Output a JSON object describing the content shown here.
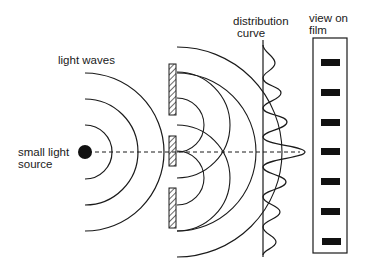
{
  "diagram": {
    "labels": {
      "light_waves": "light waves",
      "source_line1": "small light",
      "source_line2": "source",
      "distribution_line1": "distribution",
      "distribution_line2": "curve",
      "film_line1": "view on",
      "film_line2": "film"
    },
    "components": {
      "source": {
        "cx": 85,
        "cy": 152,
        "r": 7
      },
      "source_wave_radii": [
        27,
        53,
        79
      ],
      "barrier_pieces": [
        {
          "y1": 64,
          "y2": 115
        },
        {
          "y1": 136,
          "y2": 166
        },
        {
          "y1": 188,
          "y2": 228
        }
      ],
      "slits_y": [
        125,
        178
      ],
      "slit_wave_radii": [
        27,
        53
      ],
      "outer_wave_radii": [
        79,
        105
      ],
      "distribution_peaks": [
        {
          "y": 63,
          "amp": 12
        },
        {
          "y": 93,
          "amp": 18
        },
        {
          "y": 122,
          "amp": 24
        },
        {
          "y": 152,
          "amp": 42
        },
        {
          "y": 182,
          "amp": 23
        },
        {
          "y": 212,
          "amp": 17
        },
        {
          "y": 242,
          "amp": 13
        }
      ],
      "film_bands_y": [
        63,
        93,
        122,
        152,
        182,
        212,
        242
      ]
    },
    "colors": {
      "stroke": "#1a1a1a",
      "background": "#ffffff"
    }
  }
}
